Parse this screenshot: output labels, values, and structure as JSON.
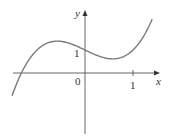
{
  "chart_data": {
    "type": "line",
    "title": "",
    "xlabel": "x",
    "ylabel": "y",
    "function": "x^3 - x + 1",
    "x_ticks": [
      {
        "value": 0,
        "label": "0"
      },
      {
        "value": 1,
        "label": "1"
      }
    ],
    "y_ticks": [
      {
        "value": 1,
        "label": "1"
      }
    ],
    "xlim": [
      -1.52,
      1.4
    ],
    "grid": false,
    "legend": null,
    "series": [
      {
        "name": "f(x)",
        "x": [
          -1.52,
          -1.4,
          -1.2,
          -1.0,
          -0.8,
          -0.6,
          -0.4,
          -0.2,
          0.0,
          0.2,
          0.4,
          0.6,
          0.8,
          1.0,
          1.2,
          1.4
        ],
        "values": [
          -0.99,
          -0.34,
          0.47,
          1.0,
          1.29,
          1.38,
          1.34,
          1.19,
          1.0,
          0.81,
          0.66,
          0.62,
          0.71,
          1.0,
          1.53,
          2.34
        ]
      }
    ],
    "annotations": {
      "origin_label": "0",
      "x_tick_label": "1",
      "y_tick_label": "1"
    },
    "colors": {
      "curve": "#7a7a7a",
      "axes": "#555555"
    }
  },
  "labels": {
    "x_axis": "x",
    "y_axis": "y",
    "origin": "0",
    "x_one": "1",
    "y_one": "1"
  }
}
